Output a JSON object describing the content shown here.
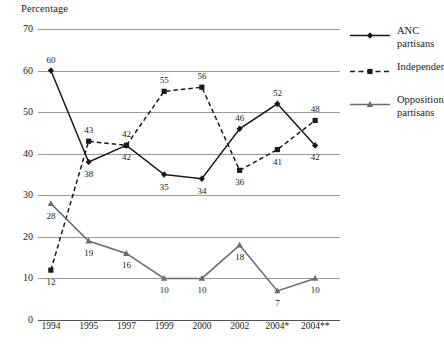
{
  "axis": {
    "y_title": "Percentage",
    "y_ticks": [
      0,
      10,
      20,
      30,
      40,
      50,
      60,
      70
    ],
    "x_ticks": [
      "1994",
      "1995",
      "1997",
      "1999",
      "2000",
      "2002",
      "2004*",
      "2004**"
    ]
  },
  "legend": {
    "items": [
      {
        "label": "ANC partisans",
        "color": "#1a1a1a",
        "style": "solid",
        "marker": "diamond"
      },
      {
        "label": "Independents",
        "color": "#1a1a1a",
        "style": "dashed",
        "marker": "square"
      },
      {
        "label": "Opposition partisans",
        "color": "#6b6b6b",
        "style": "solid",
        "marker": "triangle"
      }
    ]
  },
  "footnote": "",
  "chart_data": {
    "type": "line",
    "title": "",
    "subtitle": "",
    "xlabel": "",
    "ylabel": "Percentage",
    "ylim": [
      0,
      70
    ],
    "ytick_step": 10,
    "grid": true,
    "legend_position": "right",
    "categories": [
      "1994",
      "1995",
      "1997",
      "1999",
      "2000",
      "2002",
      "2004*",
      "2004**"
    ],
    "series": [
      {
        "name": "ANC partisans",
        "color": "#1a1a1a",
        "style": "solid",
        "marker": "diamond",
        "values": [
          60,
          38,
          42,
          35,
          34,
          46,
          52,
          42
        ],
        "label_positions": [
          "above",
          "below",
          "below",
          "below",
          "below",
          "above",
          "above",
          "below"
        ]
      },
      {
        "name": "Independents",
        "color": "#1a1a1a",
        "style": "dashed",
        "marker": "square",
        "values": [
          12,
          43,
          42,
          55,
          56,
          36,
          41,
          48
        ],
        "label_positions": [
          "below",
          "above",
          "above",
          "above",
          "above",
          "below",
          "below",
          "above"
        ]
      },
      {
        "name": "Opposition partisans",
        "color": "#6b6b6b",
        "style": "solid",
        "marker": "triangle",
        "values": [
          28,
          19,
          16,
          10,
          10,
          18,
          7,
          10
        ],
        "label_positions": [
          "below",
          "below",
          "below",
          "below",
          "below",
          "below",
          "below",
          "below"
        ]
      }
    ]
  }
}
